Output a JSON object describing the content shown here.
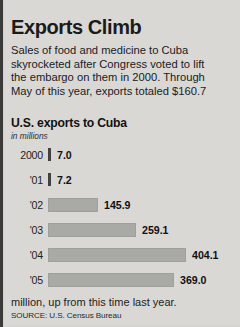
{
  "headline": "Exports Climb",
  "deck": [
    "Sales of food and medicine to Cuba",
    "skyrocketed after Congress voted to lift",
    "the embargo on them in 2000. Through",
    "May of this year, exports totaled $160.7"
  ],
  "footnote": "million, up from this time last year.",
  "source": "SOURCE: U.S. Census Bureau",
  "colors": {
    "background": "#d9d8d5",
    "bar": "#a9a9a6",
    "bar_small": "#444442",
    "text": "#1b1b1b",
    "border": "#3a3a38"
  },
  "chart_data": {
    "type": "bar",
    "orientation": "horizontal",
    "title": "U.S. exports to Cuba",
    "subtitle": "in millions",
    "xlabel": "",
    "ylabel": "",
    "grid": false,
    "legend": false,
    "xlim": [
      0,
      404.1
    ],
    "categories": [
      "2000",
      "'01",
      "'02",
      "'03",
      "'04",
      "'05"
    ],
    "values": [
      7.0,
      7.2,
      145.9,
      259.1,
      404.1,
      369.0
    ],
    "value_labels": [
      "7.0",
      "7.2",
      "145.9",
      "259.1",
      "404.1",
      "369.0"
    ],
    "units": "millions of dollars"
  }
}
